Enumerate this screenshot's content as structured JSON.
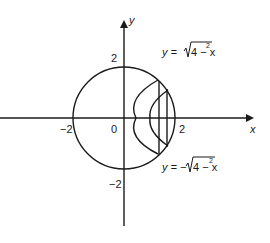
{
  "diagram": {
    "axes": {
      "x_label": "x",
      "y_label": "y",
      "origin_label": "0",
      "x_ticks": [
        "−2",
        "2"
      ],
      "y_ticks": [
        "2",
        "−2"
      ]
    },
    "curves": {
      "upper": {
        "lhs": "y = ",
        "radicand": "4 − x",
        "exp": "2"
      },
      "lower": {
        "lhs": "y = −",
        "radicand": "4 − x",
        "exp": "2"
      }
    },
    "shapes": {
      "circle": "radius 2 centered at origin",
      "inner_arcs": 2,
      "vertical_slices": 2
    }
  }
}
